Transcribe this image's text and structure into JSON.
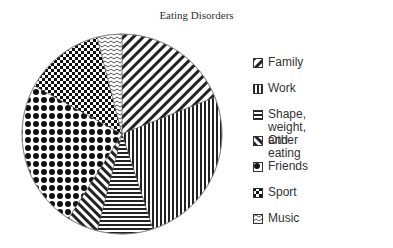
{
  "chart_data": {
    "type": "pie",
    "title": "Eating Disorders",
    "categories": [
      "Family",
      "Work",
      "Shape, weight, and eating",
      "Other",
      "Friends",
      "Sport",
      "Music"
    ],
    "values": [
      19,
      26,
      9,
      5,
      24,
      13,
      4
    ],
    "start_angle_deg": 0,
    "direction": "clockwise",
    "legend_position": "right",
    "patterns": [
      "diagonal-backslash",
      "vertical-stripes",
      "horizontal-stripes",
      "diagonal-slash",
      "dot-grid",
      "checker",
      "zigzag"
    ]
  },
  "title": "Eating Disorders",
  "legend": [
    {
      "label": "Family",
      "top": 0
    },
    {
      "label": "Work",
      "top": 26
    },
    {
      "label": "Shape, weight,\nand eating",
      "top": 52
    },
    {
      "label": "Other",
      "top": 78
    },
    {
      "label": "Friends",
      "top": 104
    },
    {
      "label": "Sport",
      "top": 130
    },
    {
      "label": "Music",
      "top": 156
    }
  ]
}
